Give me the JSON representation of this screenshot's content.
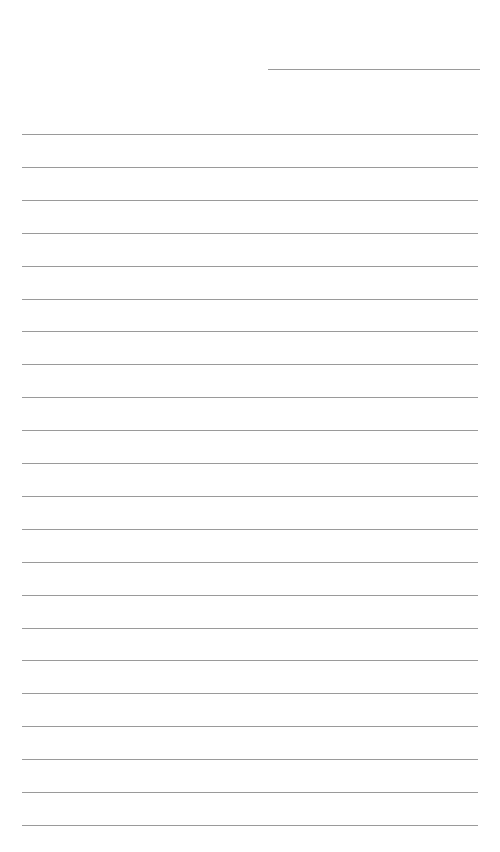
{
  "document": {
    "type": "lined-paper",
    "background": "#ffffff",
    "line_color": "#9a9a9a",
    "header_line": {
      "x": 268,
      "y": 69,
      "width": 212
    },
    "ruled_lines": {
      "count": 22,
      "x": 22,
      "width": 456,
      "first_y": 134,
      "spacing": 32.9
    },
    "text": []
  }
}
